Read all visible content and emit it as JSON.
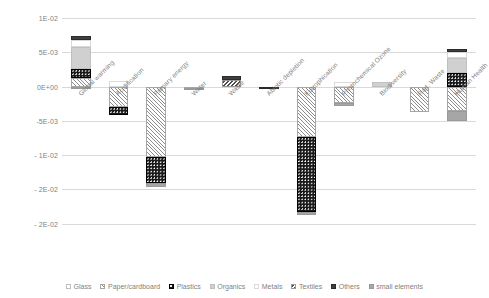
{
  "chart_data": {
    "type": "bar",
    "stacked": true,
    "title": "",
    "xlabel": "",
    "ylabel": "",
    "ylim": [
      -0.025,
      0.01
    ],
    "grid": true,
    "legend_position": "bottom",
    "ytick_labels": [
      "1E-02",
      "5E-03",
      "0E+00",
      "-5E-03",
      "- 1E-02",
      "- 2E-02",
      "- 2E-02"
    ],
    "ytick_values": [
      0.01,
      0.005,
      0.0,
      -0.005,
      -0.01,
      -0.015,
      -0.02
    ],
    "categories": [
      "Global warming",
      "Acidification",
      "Primary energy",
      "Water",
      "Waste",
      "Abiotic depletion",
      "Eutrophication",
      "Photochemical Ozone",
      "Biodiversity",
      "Rad. Waste",
      "Human Health"
    ],
    "series": [
      {
        "name": "Glass",
        "key": "glass",
        "values": [
          0.0,
          0.0,
          0.0,
          0.0,
          0.0,
          0.0,
          0.0,
          0.0,
          0.0,
          0.0,
          0.0
        ]
      },
      {
        "name": "Paper/cardboard",
        "key": "paper",
        "values": [
          0.0012,
          -0.003,
          -0.0103,
          -0.0002,
          0.0,
          0.0,
          -0.0073,
          -0.0024,
          0.0,
          -0.0037,
          -0.0036
        ]
      },
      {
        "name": "Plastics",
        "key": "plastics",
        "values": [
          0.0013,
          -0.0012,
          -0.0038,
          0.0,
          0.0,
          0.0,
          -0.011,
          0.0,
          0.0,
          0.0,
          0.002
        ]
      },
      {
        "name": "Organics",
        "key": "organics",
        "values": [
          0.0033,
          0.0,
          0.0,
          0.0,
          0.0,
          0.0,
          0.0,
          0.0,
          0.0007,
          0.0,
          0.0022
        ]
      },
      {
        "name": "Metals",
        "key": "metals",
        "values": [
          0.001,
          0.0008,
          0.0,
          0.0,
          0.0,
          0.0,
          0.0,
          0.0007,
          0.0,
          0.0,
          0.0008
        ]
      },
      {
        "name": "Textiles",
        "key": "textiles",
        "values": [
          0.0,
          0.0,
          0.0,
          -0.0003,
          0.001,
          0.0,
          0.0,
          0.0,
          0.0,
          0.0,
          0.0
        ]
      },
      {
        "name": "Others",
        "key": "others",
        "values": [
          0.0006,
          0.0,
          0.0,
          0.0,
          0.0006,
          -0.0004,
          0.0,
          0.0,
          0.0,
          0.0,
          0.0005
        ]
      },
      {
        "name": "small elements",
        "key": "small",
        "values": [
          -0.0002,
          0.0,
          -0.0005,
          0.0,
          0.0,
          0.0,
          -0.0004,
          -0.0004,
          0.0,
          0.0,
          -0.0014
        ]
      }
    ],
    "colors": {
      "glass": "#ffffff",
      "paper": "#8c8c8c",
      "plastics": "#1a1a1a",
      "organics": "#d0d0d0",
      "metals": "#bfbfbf",
      "textiles": "#4d4d4d",
      "others": "#3f3f3f",
      "small": "#a6a6a6",
      "gridline": "#d9d9d9",
      "text": "#7f7f7f"
    }
  },
  "legend": {
    "items": [
      {
        "label": "Glass",
        "key": "glass"
      },
      {
        "label": "Paper/cardboard",
        "key": "paper"
      },
      {
        "label": "Plastics",
        "key": "plastics"
      },
      {
        "label": "Organics",
        "key": "organics"
      },
      {
        "label": "Metals",
        "key": "metals"
      },
      {
        "label": "Textiles",
        "key": "textiles"
      },
      {
        "label": "Others",
        "key": "others"
      },
      {
        "label": "small elements",
        "key": "small"
      }
    ]
  }
}
